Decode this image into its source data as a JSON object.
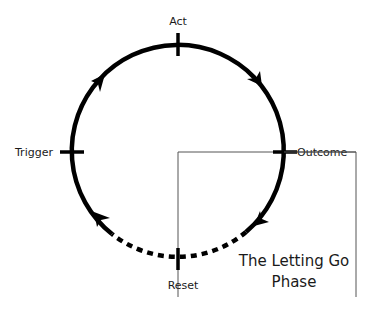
{
  "diagram": {
    "stages": {
      "act": "Act",
      "outcome": "Outcome",
      "reset": "Reset",
      "trigger": "Trigger"
    },
    "highlight": {
      "line1": "The Letting Go",
      "line2": "Phase"
    },
    "colors": {
      "stroke": "#000000",
      "thin_line": "#555555",
      "text": "#1a1a1a",
      "background": "#ffffff"
    }
  }
}
